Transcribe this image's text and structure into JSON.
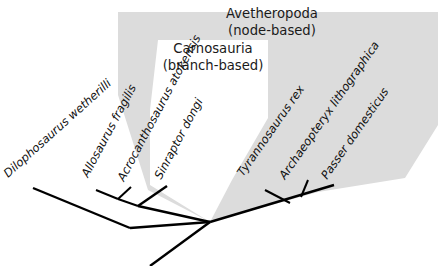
{
  "figure": {
    "type": "cladogram",
    "background_color": "#ffffff",
    "line_color": "#000000"
  },
  "clades": [
    {
      "id": "avetheropoda",
      "name": "Avetheropoda",
      "kind": "(node-based)",
      "fill_color": "#dcdcdc",
      "name_x": 272,
      "name_y": 18,
      "kind_y": 35,
      "polygon": "118,12 438,12 438,125 405,178 318,192 210,222 148,190 118,95"
    },
    {
      "id": "carnosauria",
      "name": "Carnosauria",
      "kind": "(branch-based)",
      "fill_color": "#ffffff",
      "name_x": 213,
      "name_y": 53,
      "kind_y": 70,
      "polygon": "158,40 268,40 268,118 232,180 210,222 150,185 150,110"
    }
  ],
  "taxa": [
    {
      "id": "dilophosaurus",
      "label": "Dilophosaurus wetherilli",
      "label_x": 8,
      "label_y": 178,
      "rotation": -42,
      "tip_x": 33,
      "tip_y": 188,
      "base_x": 130,
      "base_y": 228
    },
    {
      "id": "allosaurus",
      "label": "Allosaurus fragilis",
      "label_x": 88,
      "label_y": 178,
      "rotation": -62,
      "tip_x": 96,
      "tip_y": 190,
      "base_x": 118,
      "base_y": 199
    },
    {
      "id": "acrocanthosaurus",
      "label": "Acrocanthosaurus atokensis",
      "label_x": 124,
      "label_y": 182,
      "rotation": -62,
      "tip_x": 131,
      "tip_y": 187,
      "base_x": 118,
      "base_y": 199
    },
    {
      "id": "sinraptor",
      "label": "Sinraptor dongi",
      "label_x": 161,
      "label_y": 180,
      "rotation": -62,
      "tip_x": 167,
      "tip_y": 186,
      "base_x": 138,
      "base_y": 206
    },
    {
      "id": "tyrannosaurus",
      "label": "Tyrannosaurus rex",
      "label_x": 243,
      "label_y": 177,
      "rotation": -55,
      "tip_x": 265,
      "tip_y": 190,
      "base_x": 290,
      "base_y": 203
    },
    {
      "id": "archaeopteryx",
      "label": "Archaeopteryx lithographica",
      "label_x": 285,
      "label_y": 180,
      "rotation": -55,
      "tip_x": 308,
      "tip_y": 180,
      "base_x": 301,
      "base_y": 197
    },
    {
      "id": "passer",
      "label": "Passer domesticus",
      "label_x": 327,
      "label_y": 180,
      "rotation": -55,
      "tip_x": 334,
      "tip_y": 185,
      "base_x": 320,
      "base_y": 192
    }
  ],
  "branch_paths": {
    "root_spine": "M 150,266 L 210,222",
    "spine_to_dilo_node": "M 210,222 L 130,228",
    "dilo_branch": "M 130,228 L 33,188",
    "carno_spine": "M 210,222 L 138,206",
    "carno_to_allo_acro": "M 138,206 L 118,199",
    "allo_tip": "M 118,199 L 96,190",
    "acro_tip": "M 118,199 L 131,187",
    "sinraptor_tip": "M 138,206 L 167,186",
    "avetheropod_right_spine": "M 210,222 L 334,185",
    "tyranno_node": "M 290,203 L 265,190",
    "archaeo_node": "M 301,197 L 308,180"
  }
}
